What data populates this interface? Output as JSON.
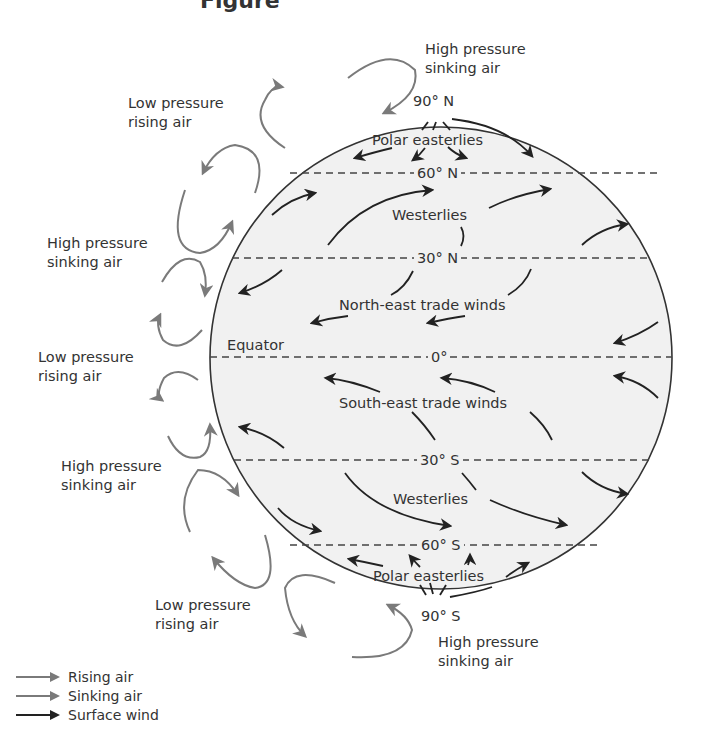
{
  "title_fragment": "Figure",
  "colors": {
    "globe_fill": "#f1f1f1",
    "globe_outline": "#333333",
    "latitude_line": "#444444",
    "rising_air": "#7a7a7a",
    "sinking_air": "#7a7a7a",
    "surface_wind": "#222222"
  },
  "latitudes": [
    {
      "label": "90° N",
      "y": 127
    },
    {
      "label": "60° N",
      "y": 173
    },
    {
      "label": "30° N",
      "y": 258
    },
    {
      "label": "0°",
      "y": 357
    },
    {
      "label": "30° S",
      "y": 460
    },
    {
      "label": "60° S",
      "y": 545
    },
    {
      "label": "90° S",
      "y": 590
    }
  ],
  "labels": {
    "n90": "90° N",
    "n60": "60° N",
    "n30": "30° N",
    "eq": "0°",
    "s30": "30° S",
    "s60": "60° S",
    "s90": "90° S",
    "equator": "Equator"
  },
  "wind_belts": {
    "polar_easterlies_north": "Polar easterlies",
    "westerlies_north": "Westerlies",
    "ne_trades": "North-east trade winds",
    "se_trades": "South-east trade winds",
    "westerlies_south": "Westerlies",
    "polar_easterlies_south": "Polar easterlies"
  },
  "pressure_labels": {
    "top_high": [
      "High pressure",
      "sinking air"
    ],
    "low_60n": [
      "Low pressure",
      "rising air"
    ],
    "high_30n": [
      "High pressure",
      "sinking air"
    ],
    "low_eq": [
      "Low pressure",
      "rising air"
    ],
    "high_30s": [
      "High pressure",
      "sinking air"
    ],
    "low_60s": [
      "Low pressure",
      "rising air"
    ],
    "bottom_high": [
      "High pressure",
      "sinking air"
    ]
  },
  "legend": [
    {
      "label": "Rising air",
      "icon": "rising-air-arrow",
      "color": "#7a7a7a"
    },
    {
      "label": "Sinking air",
      "icon": "sinking-air-arrow",
      "color": "#7a7a7a"
    },
    {
      "label": "Surface wind",
      "icon": "surface-wind-arrow",
      "color": "#222222"
    }
  ]
}
